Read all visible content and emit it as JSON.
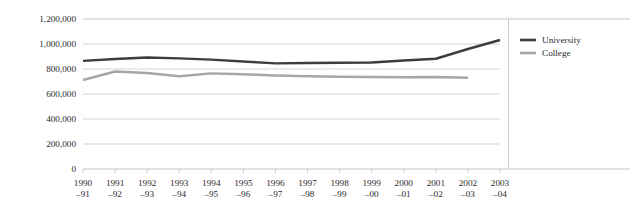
{
  "chart_data": {
    "type": "line",
    "title": "",
    "xlabel": "",
    "ylabel": "",
    "ylim": [
      0,
      1200000
    ],
    "ytick_step": 200000,
    "grid": true,
    "legend_position": "right",
    "categories": [
      "1990–91",
      "1991–92",
      "1992–93",
      "1993–94",
      "1994–95",
      "1995–96",
      "1996–97",
      "1997–98",
      "1998–99",
      "1999–00",
      "2000–01",
      "2001–02",
      "2002–03",
      "2003–04"
    ],
    "category_lines": [
      [
        "1990",
        "–91"
      ],
      [
        "1991",
        "–92"
      ],
      [
        "1992",
        "–93"
      ],
      [
        "1993",
        "–94"
      ],
      [
        "1994",
        "–95"
      ],
      [
        "1995",
        "–96"
      ],
      [
        "1996",
        "–97"
      ],
      [
        "1997",
        "–98"
      ],
      [
        "1998",
        "–99"
      ],
      [
        "1999",
        "–00"
      ],
      [
        "2000",
        "–01"
      ],
      [
        "2001",
        "–02"
      ],
      [
        "2002",
        "–03"
      ],
      [
        "2003",
        "–04"
      ]
    ],
    "ytick_labels": [
      "1,200,000",
      "1,000,000",
      "800,000",
      "600,000",
      "400,000",
      "200,000",
      "0"
    ],
    "ytick_values": [
      1200000,
      1000000,
      800000,
      600000,
      400000,
      200000,
      0
    ],
    "series": [
      {
        "name": "University",
        "color": "#3d3d3d",
        "values": [
          865000,
          880000,
          892000,
          885000,
          875000,
          860000,
          845000,
          848000,
          850000,
          852000,
          868000,
          882000,
          960000,
          1032000
        ]
      },
      {
        "name": "College",
        "color": "#a6a6a6",
        "values": [
          712000,
          780000,
          768000,
          742000,
          765000,
          758000,
          748000,
          742000,
          738000,
          736000,
          734000,
          736000,
          730000,
          null
        ]
      }
    ]
  },
  "legend": {
    "items": [
      {
        "label": "University",
        "color": "#3d3d3d"
      },
      {
        "label": "College",
        "color": "#a6a6a6"
      }
    ]
  }
}
